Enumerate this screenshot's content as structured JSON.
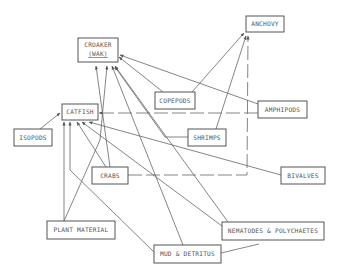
{
  "nodes": [
    {
      "id": "croaker",
      "label": "CROAKER",
      "sublabel": "(WAK)"
    },
    {
      "id": "anchovy",
      "label": "ANCHOVY"
    },
    {
      "id": "catfish",
      "label": "CATFISH"
    },
    {
      "id": "copepods",
      "label": "COPEPODS"
    },
    {
      "id": "amphipods",
      "label": "AMPHIPODS"
    },
    {
      "id": "isopods",
      "label": "ISOPODS"
    },
    {
      "id": "shrimps",
      "label": "SHRIMPS"
    },
    {
      "id": "crabs",
      "label": "CRABS"
    },
    {
      "id": "bivalves",
      "label": "BIVALVES"
    },
    {
      "id": "plant_material",
      "label": "PLANT MATERIAL"
    },
    {
      "id": "nematodes",
      "label": "NEMATODES & POLYCHAETES"
    },
    {
      "id": "mud",
      "label": "MUD & DETRITUS"
    }
  ],
  "edges": [
    {
      "from": "copepods",
      "to": "croaker",
      "style": "solid"
    },
    {
      "from": "copepods",
      "to": "anchovy",
      "style": "solid"
    },
    {
      "from": "amphipods",
      "to": "croaker",
      "style": "solid"
    },
    {
      "from": "amphipods",
      "to": "catfish",
      "style": "dashed"
    },
    {
      "from": "shrimps",
      "to": "croaker",
      "style": "solid"
    },
    {
      "from": "shrimps",
      "to": "anchovy",
      "style": "solid"
    },
    {
      "from": "crabs",
      "to": "croaker",
      "style": "solid"
    },
    {
      "from": "crabs",
      "to": "catfish",
      "style": "solid"
    },
    {
      "from": "crabs",
      "to": "anchovy",
      "style": "dashed"
    },
    {
      "from": "isopods",
      "to": "catfish",
      "style": "solid"
    },
    {
      "from": "bivalves",
      "to": "catfish",
      "style": "solid"
    },
    {
      "from": "plant_material",
      "to": "catfish",
      "style": "solid"
    },
    {
      "from": "plant_material",
      "to": "croaker",
      "style": "solid"
    },
    {
      "from": "nematodes",
      "to": "croaker",
      "style": "solid"
    },
    {
      "from": "nematodes",
      "to": "catfish",
      "style": "solid"
    },
    {
      "from": "mud",
      "to": "croaker",
      "style": "solid"
    },
    {
      "from": "mud",
      "to": "catfish",
      "style": "solid"
    },
    {
      "from": "mud",
      "to": "nematodes",
      "style": "solid"
    }
  ]
}
